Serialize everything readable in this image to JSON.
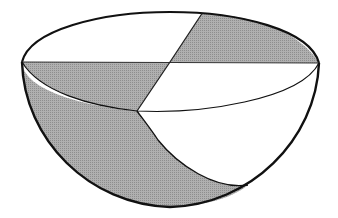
{
  "diagram": {
    "colors": {
      "background": "#ffffff",
      "shaded": "#a8a8a8",
      "unshaded": "#ffffff",
      "stroke": "#111111"
    },
    "regions": [
      {
        "name": "top-back-right-quadrant",
        "shaded": true
      },
      {
        "name": "top-back-left-quadrant",
        "shaded": false
      },
      {
        "name": "top-front-left-quadrant",
        "shaded": true
      },
      {
        "name": "top-front-right-quadrant",
        "shaded": false
      },
      {
        "name": "bowl-left-wall",
        "shaded": true
      },
      {
        "name": "bowl-right-wall",
        "shaded": false
      }
    ]
  }
}
